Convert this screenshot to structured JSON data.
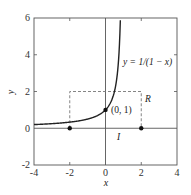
{
  "chart_data": {
    "type": "line",
    "title": "",
    "xlabel": "x",
    "ylabel": "y",
    "xlim": [
      -4,
      4
    ],
    "ylim": [
      -2,
      6
    ],
    "xticks": [
      "-4",
      "-2",
      "0",
      "2",
      "4"
    ],
    "yticks": [
      "-2",
      "0",
      "2",
      "4",
      "6"
    ],
    "grid": false,
    "series": [
      {
        "name": "y = 1/(1 - x)",
        "function": "1/(1-x)",
        "x_range": [
          -4,
          0.83
        ],
        "color": "#222222"
      }
    ],
    "points": [
      {
        "x": 0,
        "y": 1,
        "label": "(0, 1)"
      },
      {
        "x": -2,
        "y": 0,
        "label": ""
      },
      {
        "x": 2,
        "y": 0,
        "label": ""
      }
    ],
    "rectangle": {
      "x0": -2,
      "x1": 2,
      "y0": 0,
      "y1": 2,
      "style": "dashed",
      "label": "R"
    },
    "interval_label": "I",
    "annotations": {
      "curve_label": "y = 1/(1 − x)",
      "point_label": "(0, 1)",
      "rect_label": "R",
      "interval_label": "I"
    }
  }
}
